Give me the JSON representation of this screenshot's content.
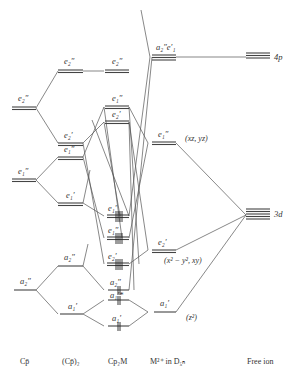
{
  "columns": [
    {
      "id": "cp",
      "label": "Cp̄"
    },
    {
      "id": "cp2",
      "label": "(Cp̄)₂"
    },
    {
      "id": "cp2m",
      "label": "Cp₂M"
    },
    {
      "id": "m_d5h",
      "label": "M²⁺ in D₅ₕ"
    },
    {
      "id": "free_ion",
      "label": "Free ion"
    }
  ],
  "levels": {
    "cp": [
      {
        "sym": "e₂″",
        "y": 88
      },
      {
        "sym": "e₁″",
        "y": 180
      },
      {
        "sym": "a₂″",
        "y": 290
      }
    ],
    "cp2": [
      {
        "sym": "e₂″",
        "y": 70
      },
      {
        "sym": "e₂′",
        "y": 143
      },
      {
        "sym": "e₁″",
        "y": 157
      },
      {
        "sym": "e₁′",
        "y": 203
      },
      {
        "sym": "a₂″",
        "y": 266
      },
      {
        "sym": "a₁′",
        "y": 314
      }
    ],
    "cp2m": [
      {
        "sym": "e₂″",
        "y": 70
      },
      {
        "sym": "e₁″",
        "y": 107
      },
      {
        "sym": "e₂′",
        "y": 122
      },
      {
        "sym": "e₁′",
        "y": 216,
        "occupied": true
      },
      {
        "sym": "e₁″",
        "y": 238,
        "occupied": true
      },
      {
        "sym": "e₂′",
        "y": 264,
        "occupied": true
      },
      {
        "sym": "a₂″",
        "y": 290,
        "occupied": true
      },
      {
        "sym": "a₁′*",
        "y": 300,
        "occupied": true
      },
      {
        "sym": "a₁′",
        "y": 326,
        "occupied": true
      }
    ],
    "m_d5h": [
      {
        "sym": "a₂″e′₁",
        "y": 57
      },
      {
        "sym": "e₁″",
        "y": 143,
        "annotation": "(xz, yz)"
      },
      {
        "sym": "e₂′",
        "y": 250,
        "annotation": "(x² − y², xy)"
      },
      {
        "sym": "a₁′",
        "y": 312,
        "annotation": "(z²)"
      }
    ],
    "free_ion": [
      {
        "sym": "4p",
        "y": 57
      },
      {
        "sym": "3d",
        "y": 215
      }
    ]
  },
  "labels": {
    "cp_e2pp": "e₂″",
    "cp_e1pp": "e₁″",
    "cp_a2pp": "a₂″",
    "cp2_e2pp": "e₂″",
    "cp2_e2p": "e₂′",
    "cp2_e1pp": "e₁″",
    "cp2_e1p": "e₁′",
    "cp2_a2pp": "a₂″",
    "cp2_a1p": "a₁′",
    "cp2m_e2pp": "e₂″",
    "cp2m_e1pp_hi": "e₁″",
    "cp2m_e2p_hi": "e₂′",
    "cp2m_e1p": "e₁′",
    "cp2m_e1pp_lo": "e₁″",
    "cp2m_e2p_lo": "e₂′",
    "cp2m_a2pp": "a₂″",
    "cp2m_a1p_star": "a₁′*",
    "cp2m_a1p": "a₁′",
    "m_a2pp_e1p": "a₂″e′₁",
    "m_e1pp": "e₁″",
    "m_e2p": "e₂′",
    "m_a1p": "a₁′",
    "ann_xz_yz": "(xz, yz)",
    "ann_x2y2_xy": "(x² − y², xy)",
    "ann_z2": "(z²)",
    "fi_4p": "4p",
    "fi_3d": "3d"
  }
}
